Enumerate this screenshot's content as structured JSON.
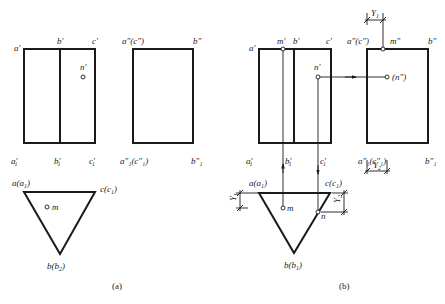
{
  "figure": {
    "panels": [
      {
        "id": "a",
        "caption": "(a)",
        "front_view": {
          "labels": {
            "a": "a'",
            "b": "b'",
            "c": "c'",
            "n": "n'",
            "a1": "a'",
            "a1_sub": "1",
            "b1": "b'",
            "b1_sub": "1",
            "c1": "c'",
            "c1_sub": "1"
          }
        },
        "side_view": {
          "labels": {
            "top_left": "a\"(c\")",
            "top_right": "b\"",
            "bottom_left": "a″₁(c″₁)",
            "bottom_right": "b″₁"
          }
        },
        "top_view": {
          "labels": {
            "a": "a(a",
            "a_sub": "1",
            "c": "c(c",
            "c_sub": "1",
            "b": "b(b",
            "b_sub": "2",
            "m": "m"
          }
        }
      },
      {
        "id": "b",
        "caption": "(b)",
        "front_view": {
          "labels": {
            "a": "a'",
            "m": "m'",
            "b": "b'",
            "c": "c'",
            "n": "n'",
            "a1": "a'",
            "b1": "b'",
            "c1": "c'",
            "sub": "1"
          }
        },
        "side_view": {
          "labels": {
            "top_left": "a\"(c\")",
            "m": "m\"",
            "top_right": "b\"",
            "n": "(n\")",
            "bottom_left": "a″₁(c″₁)",
            "bottom_right": "b″₁"
          },
          "dimensions": {
            "top": "Y",
            "top_sub": "1",
            "bottom": "Y",
            "bottom_sub": "2"
          }
        },
        "top_view": {
          "labels": {
            "a": "a(a",
            "a_sub": "1",
            "c": "c(c",
            "c_sub": "1",
            "b": "b(b",
            "b_sub": "1",
            "m": "m",
            "n": "n"
          },
          "dimensions": {
            "left": "Y",
            "left_sub": "1",
            "right": "Y",
            "right_sub": "2"
          }
        }
      }
    ]
  }
}
